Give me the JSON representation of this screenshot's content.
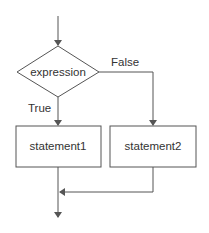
{
  "diagram": {
    "type": "flowchart",
    "colors": {
      "stroke": "#555555",
      "text": "#333333",
      "background": "#ffffff"
    },
    "decision": {
      "label": "expression"
    },
    "branches": {
      "true_label": "True",
      "false_label": "False"
    },
    "statements": [
      {
        "label": "statement1"
      },
      {
        "label": "statement2"
      }
    ]
  }
}
